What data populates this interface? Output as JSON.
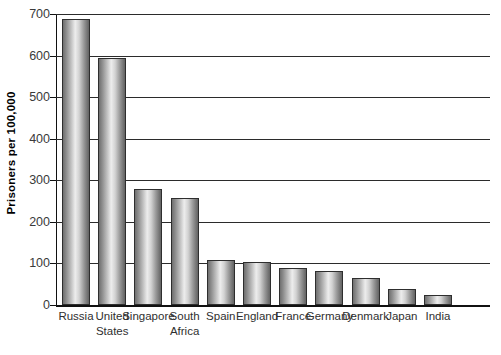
{
  "chart_data": {
    "type": "bar",
    "title": "",
    "subtitle": "",
    "xlabel": "",
    "ylabel": "Prisoners per 100,000",
    "ylim": [
      0,
      700
    ],
    "yticks": [
      0,
      100,
      200,
      300,
      400,
      500,
      600,
      700
    ],
    "ytick_labels": [
      "0",
      "100",
      "200",
      "300",
      "400",
      "500",
      "600",
      "700"
    ],
    "grid": true,
    "legend": "none",
    "orientation": "vertical",
    "categories": [
      "Russia",
      "United States",
      "Singapore",
      "South Africa",
      "Spain",
      "England",
      "France",
      "Germany",
      "Denmark",
      "Japan",
      "India"
    ],
    "category_lines": [
      [
        "Russia",
        ""
      ],
      [
        "United",
        "States"
      ],
      [
        "Singapore",
        ""
      ],
      [
        "South",
        "Africa"
      ],
      [
        "Spain",
        ""
      ],
      [
        "England",
        ""
      ],
      [
        "France",
        ""
      ],
      [
        "Germany",
        ""
      ],
      [
        "Denmark",
        ""
      ],
      [
        "Japan",
        ""
      ],
      [
        "India",
        ""
      ]
    ],
    "values": [
      688,
      595,
      280,
      258,
      108,
      103,
      90,
      82,
      66,
      38,
      24
    ],
    "bar_style": {
      "fill": "vertical-cylinder-gradient-gray",
      "edge_color": "#2e2e2e",
      "highlight_color": "#ededed",
      "shadow_color": "#636363"
    },
    "axis_color": "#111111",
    "gridline_color": "#2b2b2b",
    "background_color": "#ffffff"
  }
}
